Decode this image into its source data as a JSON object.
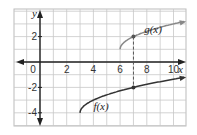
{
  "chart_data": {
    "type": "line",
    "title": "",
    "xlabel": "x",
    "ylabel": "y",
    "xlim": [
      -2,
      11
    ],
    "ylim": [
      -5,
      4
    ],
    "grid": true,
    "x_ticks": [
      0,
      2,
      4,
      6,
      8,
      10
    ],
    "x_tick_labels": [
      "0",
      "2",
      "4",
      "6",
      "8",
      "10"
    ],
    "y_ticks": [
      2,
      -2,
      -4
    ],
    "y_tick_labels": [
      "2",
      "-2",
      "-4"
    ],
    "series": [
      {
        "name": "g(x)",
        "label": "g(x)",
        "start": [
          6,
          1
        ],
        "points": [
          [
            6,
            1
          ],
          [
            6.25,
            1.5
          ],
          [
            7,
            2
          ],
          [
            8,
            2.41
          ],
          [
            9,
            2.73
          ],
          [
            10,
            3
          ],
          [
            11,
            3.24
          ]
        ],
        "color": "#888888"
      },
      {
        "name": "f(x)",
        "label": "f(x)",
        "start": [
          3,
          -4
        ],
        "points": [
          [
            3,
            -4
          ],
          [
            3.25,
            -3.5
          ],
          [
            4,
            -3
          ],
          [
            5,
            -2.59
          ],
          [
            7,
            -2
          ],
          [
            9,
            -1.55
          ],
          [
            11,
            -1.17
          ]
        ],
        "color": "#333333"
      }
    ],
    "annotations": [
      {
        "type": "dashed-vertical",
        "x": 7,
        "from_y": -2,
        "to_y": 2
      },
      {
        "type": "point",
        "x": 7,
        "y": 2
      },
      {
        "type": "point",
        "x": 7,
        "y": -2
      }
    ]
  },
  "labels": {
    "x_axis": "x",
    "y_axis": "y",
    "g_label": "g(x)",
    "f_label": "f(x)",
    "x_ticks": [
      "0",
      "2",
      "4",
      "6",
      "8",
      "10"
    ],
    "y_ticks": [
      "2",
      "-2",
      "-4"
    ]
  }
}
